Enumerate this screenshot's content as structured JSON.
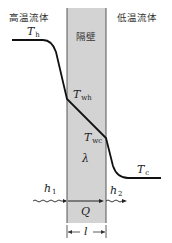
{
  "diagram": {
    "type": "heat-conduction-through-wall",
    "labels": {
      "hot_fluid": "高温流体",
      "cold_fluid": "低温流体",
      "wall": "隔壁",
      "T_h": {
        "main": "T",
        "sub": "h"
      },
      "T_wh": {
        "main": "T",
        "sub": "wh"
      },
      "T_wc": {
        "main": "T",
        "sub": "wc"
      },
      "T_c": {
        "main": "T",
        "sub": "c"
      },
      "lambda": "λ",
      "h1": {
        "main": "h",
        "sub": "1"
      },
      "h2": {
        "main": "h",
        "sub": "2"
      },
      "Q": "Q",
      "l": "l"
    },
    "colors": {
      "wall_fill": "#d3d3d3",
      "wall_edge": "#555555",
      "curve": "#111111",
      "background": "#ffffff"
    }
  }
}
